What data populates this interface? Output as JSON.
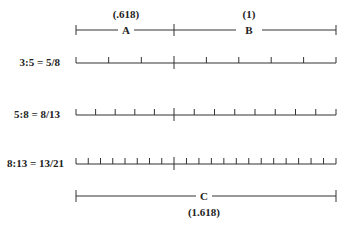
{
  "diagram": {
    "geometry": {
      "x_left": 76,
      "x_divider": 174,
      "x_right": 336
    },
    "top_segments": {
      "A": {
        "label": "A",
        "value": "(.618)"
      },
      "B": {
        "label": "B",
        "value": "(1)"
      }
    },
    "rows": [
      {
        "label": "3:5 = 5/8",
        "left_parts": 3,
        "right_parts": 5,
        "y": 63
      },
      {
        "label": "5:8 = 8/13",
        "left_parts": 5,
        "right_parts": 8,
        "y": 115
      },
      {
        "label": "8:13 = 13/21",
        "left_parts": 8,
        "right_parts": 13,
        "y": 164
      }
    ],
    "bottom_segment": {
      "label": "C",
      "value": "(1.618)"
    },
    "colors": {
      "line": "#333333",
      "text": "#222222",
      "background": "#ffffff"
    }
  }
}
